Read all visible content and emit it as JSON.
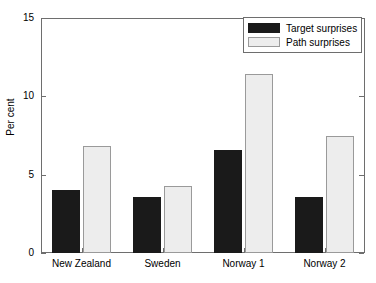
{
  "chart_data": {
    "type": "bar",
    "title": "",
    "xlabel": "",
    "ylabel": "Per cent",
    "categories": [
      "New Zealand",
      "Sweden",
      "Norway 1",
      "Norway 2"
    ],
    "series": [
      {
        "name": "Target surprises",
        "color": "#1a1a1a",
        "values": [
          4.0,
          3.6,
          6.6,
          3.6
        ]
      },
      {
        "name": "Path surprises",
        "color": "#ededed",
        "values": [
          6.8,
          4.3,
          11.4,
          7.5
        ]
      }
    ],
    "ylim": [
      0,
      15
    ],
    "yticks": [
      0,
      5,
      10,
      15
    ],
    "ytick_labels": [
      "0",
      "5",
      "10",
      "15"
    ],
    "grid": false,
    "legend_position": "top-right"
  },
  "legend": {
    "entries": [
      {
        "label": "Target surprises",
        "swatch": "dark-swatch"
      },
      {
        "label": "Path surprises",
        "swatch": "light-swatch"
      }
    ]
  },
  "axes": {
    "y_label": "Per cent",
    "y_ticks": [
      "0",
      "5",
      "10",
      "15"
    ],
    "x_ticks": [
      "New Zealand",
      "Sweden",
      "Norway 1",
      "Norway 2"
    ]
  },
  "colors": {
    "target": "#1a1a1a",
    "path": "#ededed",
    "axis": "#6e6e6e",
    "background": "#ffffff"
  }
}
